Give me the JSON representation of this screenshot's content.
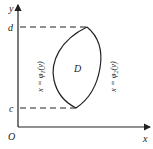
{
  "diagram": {
    "axes": {
      "x_label": "x",
      "y_label": "y",
      "origin_label": "O"
    },
    "y_ticks": {
      "top": "d",
      "bottom": "c"
    },
    "region_label": "D",
    "left_curve": {
      "text_main": "x = φ",
      "subscript": "1",
      "text_tail": "(y)"
    },
    "right_curve": {
      "text_main": "x = φ",
      "subscript": "2",
      "text_tail": "(y)"
    },
    "colors": {
      "stroke": "#222222",
      "background": "#ffffff"
    }
  }
}
